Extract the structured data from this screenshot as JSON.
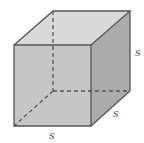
{
  "diagram": {
    "type": "cube",
    "labels": {
      "height": "s",
      "depth": "s",
      "width": "s"
    },
    "colors": {
      "top_face": "#d9d9d9",
      "front_face": "#c6c6c6",
      "right_face": "#ababab",
      "edge": "#555555",
      "hidden_edge": "#555555",
      "label": "#555555"
    },
    "vertices": {
      "front_top_left": [
        14,
        45
      ],
      "front_top_right": [
        91,
        45
      ],
      "front_bottom_left": [
        14,
        126
      ],
      "front_bottom_right": [
        91,
        126
      ],
      "back_top_left": [
        53,
        11
      ],
      "back_top_right": [
        130,
        11
      ],
      "back_bottom_right": [
        130,
        91
      ],
      "back_bottom_left_hidden": [
        53,
        91
      ]
    }
  }
}
